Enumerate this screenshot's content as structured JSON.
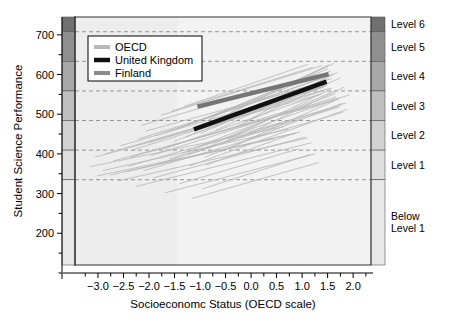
{
  "chart_data": {
    "type": "line",
    "title": "",
    "xlabel": "Socioeconomc Status (OECD scale)",
    "ylabel": "Student Science Performance",
    "xlim": [
      -3.45,
      2.35
    ],
    "ylim": [
      120,
      745
    ],
    "xticks": [
      -3.0,
      -2.5,
      -2.0,
      -1.5,
      -1.0,
      -0.5,
      0.0,
      0.5,
      1.0,
      1.5,
      2.0
    ],
    "xtick_labels": [
      "-3.0",
      "-2.5",
      "-2.0",
      "-1.5",
      "-1.0",
      "-0.5",
      "0.0",
      "0.5",
      "1.0",
      "1.5",
      "2.0"
    ],
    "yticks": [
      200,
      300,
      400,
      500,
      600,
      700
    ],
    "ytick_labels": [
      "200",
      "300",
      "400",
      "500",
      "600",
      "700"
    ],
    "yminorticks": [
      150,
      250,
      350,
      450,
      550,
      650
    ],
    "grid": "horizontal-dashed-at-proficiency-levels",
    "legend_position": "top-left-inside",
    "proficiency_levels": [
      {
        "label": "Level 6",
        "lower": 707.9,
        "upper": 745,
        "shade": "#707070"
      },
      {
        "label": "Level 5",
        "lower": 633.3,
        "upper": 707.9,
        "shade": "#8f8f8f"
      },
      {
        "label": "Level 4",
        "lower": 558.7,
        "upper": 633.3,
        "shade": "#a8a8a8"
      },
      {
        "label": "Level 3",
        "lower": 484.1,
        "upper": 558.7,
        "shade": "#bfbfbf"
      },
      {
        "label": "Level 2",
        "lower": 409.5,
        "upper": 484.1,
        "shade": "#d2d2d2"
      },
      {
        "label": "Level 1",
        "lower": 334.9,
        "upper": 409.5,
        "shade": "#dedede"
      },
      {
        "label": "Below\nLevel 1",
        "lower": 120,
        "upper": 334.9,
        "shade": "#e8e8e8"
      }
    ],
    "series": [
      {
        "name": "OECD",
        "color": "#b9b9b9",
        "width": 1,
        "description": "Individual OECD country socioeconomic gradient lines",
        "lines": [
          {
            "x0": -3.05,
            "y0": 392,
            "x1": 1.3,
            "y1": 548
          },
          {
            "x0": -2.85,
            "y0": 400,
            "x1": 1.55,
            "y1": 566
          },
          {
            "x0": -2.7,
            "y0": 382,
            "x1": 1.62,
            "y1": 534
          },
          {
            "x0": -2.55,
            "y0": 421,
            "x1": 1.48,
            "y1": 572
          },
          {
            "x0": -2.4,
            "y0": 369,
            "x1": 1.7,
            "y1": 520
          },
          {
            "x0": -2.3,
            "y0": 411,
            "x1": 1.35,
            "y1": 556
          },
          {
            "x0": -2.2,
            "y0": 438,
            "x1": 1.58,
            "y1": 590
          },
          {
            "x0": -2.1,
            "y0": 358,
            "x1": 1.8,
            "y1": 505
          },
          {
            "x0": -2.0,
            "y0": 428,
            "x1": 1.42,
            "y1": 568
          },
          {
            "x0": -1.95,
            "y0": 396,
            "x1": 1.66,
            "y1": 543
          },
          {
            "x0": -1.85,
            "y0": 447,
            "x1": 1.52,
            "y1": 596
          },
          {
            "x0": -1.8,
            "y0": 376,
            "x1": 1.74,
            "y1": 519
          },
          {
            "x0": -1.72,
            "y0": 412,
            "x1": 1.38,
            "y1": 551
          },
          {
            "x0": -1.65,
            "y0": 455,
            "x1": 1.6,
            "y1": 601
          },
          {
            "x0": -1.58,
            "y0": 388,
            "x1": 1.85,
            "y1": 528
          },
          {
            "x0": -1.5,
            "y0": 432,
            "x1": 1.45,
            "y1": 573
          },
          {
            "x0": -1.42,
            "y0": 465,
            "x1": 1.55,
            "y1": 608
          },
          {
            "x0": -1.35,
            "y0": 402,
            "x1": 1.72,
            "y1": 540
          },
          {
            "x0": -1.28,
            "y0": 443,
            "x1": 1.4,
            "y1": 578
          },
          {
            "x0": -1.2,
            "y0": 370,
            "x1": 1.88,
            "y1": 512
          },
          {
            "x0": -1.12,
            "y0": 478,
            "x1": 1.5,
            "y1": 614
          },
          {
            "x0": -1.05,
            "y0": 418,
            "x1": 1.65,
            "y1": 552
          },
          {
            "x0": -0.98,
            "y0": 452,
            "x1": 1.35,
            "y1": 582
          },
          {
            "x0": -0.9,
            "y0": 392,
            "x1": 1.78,
            "y1": 527
          },
          {
            "x0": -0.82,
            "y0": 488,
            "x1": 1.48,
            "y1": 620
          },
          {
            "x0": -0.75,
            "y0": 425,
            "x1": 1.6,
            "y1": 557
          },
          {
            "x0": -0.68,
            "y0": 460,
            "x1": 1.42,
            "y1": 588
          },
          {
            "x0": -0.6,
            "y0": 405,
            "x1": 1.7,
            "y1": 538
          },
          {
            "x0": -0.52,
            "y0": 495,
            "x1": 1.52,
            "y1": 624
          },
          {
            "x0": -0.45,
            "y0": 437,
            "x1": 1.58,
            "y1": 565
          },
          {
            "x0": -2.75,
            "y0": 347,
            "x1": 0.95,
            "y1": 455
          },
          {
            "x0": -2.6,
            "y0": 332,
            "x1": 1.1,
            "y1": 440
          },
          {
            "x0": -2.45,
            "y0": 355,
            "x1": 0.88,
            "y1": 452
          },
          {
            "x0": -2.25,
            "y0": 318,
            "x1": 1.18,
            "y1": 428
          },
          {
            "x0": -1.9,
            "y0": 340,
            "x1": 1.05,
            "y1": 442
          },
          {
            "x0": -1.68,
            "y0": 302,
            "x1": 1.25,
            "y1": 400
          },
          {
            "x0": -1.4,
            "y0": 325,
            "x1": 0.92,
            "y1": 412
          },
          {
            "x0": -1.15,
            "y0": 288,
            "x1": 1.32,
            "y1": 378
          },
          {
            "x0": -0.95,
            "y0": 312,
            "x1": 1.15,
            "y1": 398
          },
          {
            "x0": -3.15,
            "y0": 368,
            "x1": 0.62,
            "y1": 468
          },
          {
            "x0": -3.0,
            "y0": 345,
            "x1": 0.45,
            "y1": 438
          },
          {
            "x0": -2.9,
            "y0": 358,
            "x1": 0.72,
            "y1": 462
          },
          {
            "x0": -2.15,
            "y0": 472,
            "x1": 1.28,
            "y1": 600
          },
          {
            "x0": -1.75,
            "y0": 498,
            "x1": 1.38,
            "y1": 622
          },
          {
            "x0": -1.55,
            "y0": 508,
            "x1": 1.2,
            "y1": 618
          },
          {
            "x0": -1.3,
            "y0": 520,
            "x1": 1.1,
            "y1": 625
          },
          {
            "x0": -0.4,
            "y0": 505,
            "x1": 1.62,
            "y1": 628
          },
          {
            "x0": -0.3,
            "y0": 468,
            "x1": 1.75,
            "y1": 592
          },
          {
            "x0": -0.2,
            "y0": 442,
            "x1": 1.82,
            "y1": 568
          },
          {
            "x0": -0.1,
            "y0": 482,
            "x1": 1.68,
            "y1": 605
          },
          {
            "x0": -2.05,
            "y0": 458,
            "x1": 0.8,
            "y1": 558
          },
          {
            "x0": -1.62,
            "y0": 418,
            "x1": 0.7,
            "y1": 508
          },
          {
            "x0": -1.22,
            "y0": 398,
            "x1": 0.58,
            "y1": 478
          },
          {
            "x0": -0.88,
            "y0": 372,
            "x1": 0.85,
            "y1": 452
          },
          {
            "x0": -2.35,
            "y0": 392,
            "x1": 1.92,
            "y1": 548
          }
        ]
      },
      {
        "name": "United Kingdom",
        "color": "#111111",
        "width": 4.5,
        "x0": -1.12,
        "y0": 462,
        "x1": 1.48,
        "y1": 582
      },
      {
        "name": "Finland",
        "color": "#757575",
        "width": 4.5,
        "x0": -1.05,
        "y0": 519,
        "x1": 1.52,
        "y1": 601
      }
    ],
    "legend_entries": [
      {
        "label": "OECD",
        "color": "#b9b9b9"
      },
      {
        "label": "United Kingdom",
        "color": "#111111"
      },
      {
        "label": "Finland",
        "color": "#8a8a8a"
      }
    ],
    "plot_background": "#ededed",
    "plot_background_light": "#f2f2f2",
    "plot_background_light_from_x": -1.45
  }
}
